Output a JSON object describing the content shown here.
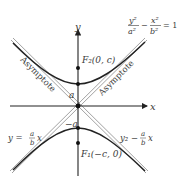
{
  "diagram": {
    "equation": {
      "num_left": "y²",
      "den_left": "a²",
      "minus": "−",
      "num_right": "x²",
      "den_right": "b²",
      "equals": "= 1"
    },
    "axes": {
      "x_label": "x",
      "y_label": "y"
    },
    "points": {
      "vertex_upper_label": "a",
      "vertex_lower_label": "−a",
      "focus_upper_label": "F₂(0, c)",
      "focus_lower_label": "F₁(−c, 0)"
    },
    "asymptotes": {
      "left_label": "Asymptote",
      "right_label": "Asymptote",
      "eq_left_prefix": "y =",
      "eq_left_num": "a",
      "eq_left_den": "b",
      "eq_left_var": "x",
      "eq_right_prefix": "y₂ −",
      "eq_right_num": "a",
      "eq_right_den": "b",
      "eq_right_var": "x"
    },
    "colors": {
      "curve": "#222222",
      "asymptote": "#888888",
      "axis": "#222222",
      "text": "#3a3a3a"
    }
  }
}
